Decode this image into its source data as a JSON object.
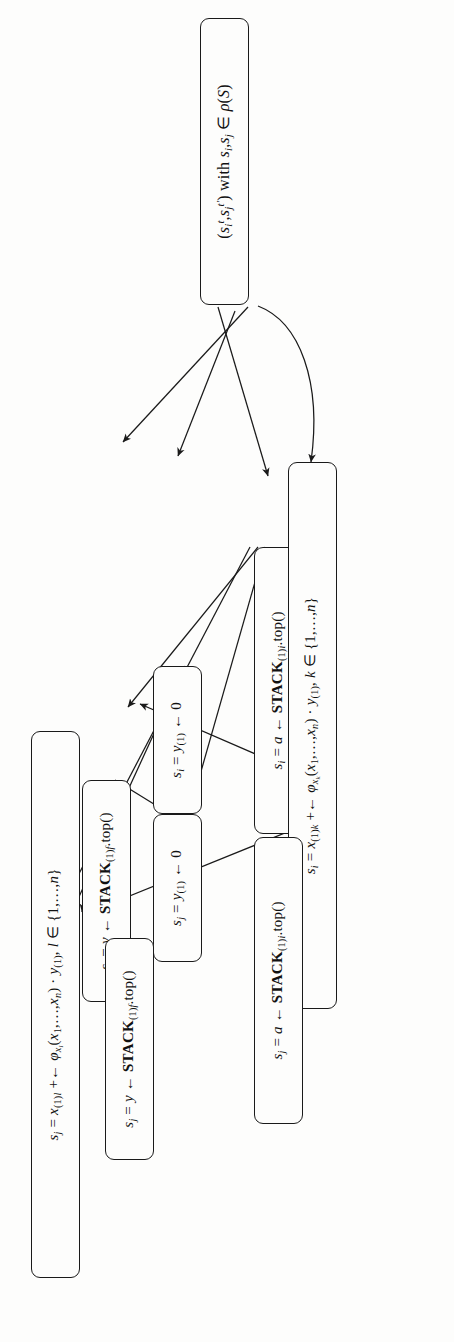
{
  "figure": {
    "kind": "flowchart",
    "orientation": "rotated-90-ccw",
    "background_color": "#fdfdfc",
    "line_color": "#1a1a1a",
    "node_shape": "rounded-rectangle"
  },
  "nodes": [
    {
      "id": "n_start",
      "plain_text": "(s_i', s_j') with s_i, s_j ∈ ρ(S)",
      "html": "(<i class=\"v\">s<span class=\"sub\"><i>i</i></span><span class=\"sup\">t</span></i>,<i class=\"v\">s<span class=\"sub\"><i>j</i></span><span class=\"sup\">t′</span></i>) with <i class=\"v\">s<span class=\"sub\"><i>i</i></span></i>,<i class=\"v\">s<span class=\"sub\"><i>j</i></span></i> ∈ <i class=\"v\">ρ</i>(<i class=\"v\">S</i>)"
    },
    {
      "id": "n_si_a_stack",
      "plain_text": "s_i = a ← STACK_(1)i.top()",
      "html": "<i class=\"v\">s<span class=\"sub\"><i>i</i></span></i> = <i class=\"v\">a</i> ← <span class=\"sc\">STACK</span><span class=\"sub\">(1)<i>i</i></span>.top()"
    },
    {
      "id": "n_si_y_zero",
      "plain_text": "s_i = y(1) ← 0",
      "html": "<i class=\"v\">s<span class=\"sub\"><i>i</i></span></i> = <i class=\"v\">y</i><span class=\"sub\">(1)</span> ← 0"
    },
    {
      "id": "n_si_y_stackf",
      "plain_text": "s_i = y ← STACK_(1)f.top()",
      "html": "<i class=\"v\">s<span class=\"sub\"><i>i</i></span></i> = <i class=\"v\">y</i> ← <span class=\"sc\">STACK</span><span class=\"sub\">(1)<i>f</i></span>.top()"
    },
    {
      "id": "n_si_phi_k",
      "plain_text": "s_i = x_(1)k +← φ_xk(x_1,...,x_n) · y_(1), k ∈ {1,...,n}",
      "html": "<i class=\"v\">s<span class=\"sub\"><i>i</i></span></i> = <i class=\"v\">x</i><span class=\"sub\">(1)<i>k</i></span> +← <i class=\"v\">φ</i><span class=\"sub\"><i>x<span class=\"sub\">k</span></i></span>(<i class=\"v\">x</i><span class=\"sub\">1</span>,…,<i class=\"v\">x<span class=\"sub\"><i>n</i></span></i>) · <i class=\"v\">y</i><span class=\"sub\">(1)</span>, <i class=\"v\">k</i> ∈ {1,…,<i class=\"v\">n</i>}"
    },
    {
      "id": "n_sj_a_stack",
      "plain_text": "s_j = a ← STACK_(1)i.top()",
      "html": "<i class=\"v\">s<span class=\"sub\"><i>j</i></span></i> = <i class=\"v\">a</i> ← <span class=\"sc\">STACK</span><span class=\"sub\">(1)<i>i</i></span>.top()"
    },
    {
      "id": "n_sj_y_zero",
      "plain_text": "s_j = y(1) ← 0",
      "html": "<i class=\"v\">s<span class=\"sub\"><i>j</i></span></i> = <i class=\"v\">y</i><span class=\"sub\">(1)</span> ← 0"
    },
    {
      "id": "n_sj_y_stackf",
      "plain_text": "s_j = y ← STACK_(1)f.top()",
      "html": "<i class=\"v\">s<span class=\"sub\"><i>j</i></span></i> = <i class=\"v\">y</i> ← <span class=\"sc\">STACK</span><span class=\"sub\">(1)<i>f</i></span>.top()"
    },
    {
      "id": "n_sj_phi_l",
      "plain_text": "s_j = x_(1)l +← φ_xl(x_1,...,x_n) · y_(1), l ∈ {1,...,n}",
      "html": "<i class=\"v\">s<span class=\"sub\"><i>j</i></span></i> = <i class=\"v\">x</i><span class=\"sub\">(1)<i>l</i></span> +← <i class=\"v\">φ</i><span class=\"sub\"><i>x<span class=\"sub\">l</span></i></span>(<i class=\"v\">x</i><span class=\"sub\">1</span>,…,<i class=\"v\">x<span class=\"sub\"><i>n</i></span></i>) · <i class=\"v\">y</i><span class=\"sub\">(1)</span>, <i class=\"v\">l</i> ∈ {1,…,<i class=\"v\">n</i>}"
    }
  ],
  "edges": [
    {
      "from": "n_start",
      "to": "n_si_a_stack"
    },
    {
      "from": "n_start",
      "to": "n_si_y_zero"
    },
    {
      "from": "n_start",
      "to": "n_si_y_stackf"
    },
    {
      "from": "n_start",
      "to": "n_si_phi_k",
      "style": "curved"
    },
    {
      "from": "n_si_a_stack",
      "to": "n_sj_a_stack"
    },
    {
      "from": "n_si_a_stack",
      "to": "n_sj_y_zero"
    },
    {
      "from": "n_si_a_stack",
      "to": "n_sj_y_stackf"
    },
    {
      "from": "n_si_a_stack",
      "to": "n_sj_phi_l"
    },
    {
      "from": "n_si_y_zero",
      "to": "n_sj_y_zero"
    },
    {
      "from": "n_si_y_zero",
      "to": "n_sj_phi_l"
    },
    {
      "from": "n_si_y_stackf",
      "to": "n_sj_y_zero"
    },
    {
      "from": "n_si_y_stackf",
      "to": "n_sj_phi_l"
    },
    {
      "from": "n_si_phi_k",
      "to": "n_sj_phi_l"
    },
    {
      "from": "n_si_phi_k",
      "to": "n_sj_y_stackf"
    }
  ]
}
